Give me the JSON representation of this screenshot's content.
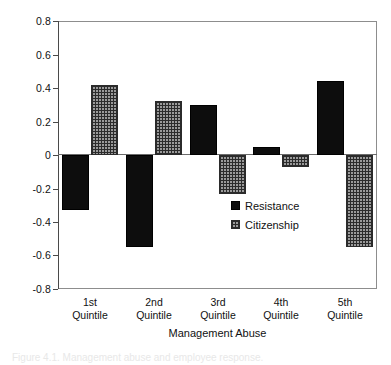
{
  "chart_data": {
    "type": "bar",
    "title": "",
    "xlabel": "Management Abuse",
    "ylabel": "",
    "categories": [
      "1st\nQuintile",
      "2nd\nQuintile",
      "3rd\nQuintile",
      "4th\nQuintile",
      "5th\nQuintile"
    ],
    "category_lines": [
      {
        "line1": "1st",
        "line2": "Quintile"
      },
      {
        "line1": "2nd",
        "line2": "Quintile"
      },
      {
        "line1": "3rd",
        "line2": "Quintile"
      },
      {
        "line1": "4th",
        "line2": "Quintile"
      },
      {
        "line1": "5th",
        "line2": "Quintile"
      }
    ],
    "series": [
      {
        "name": "Resistance",
        "values": [
          -0.33,
          -0.55,
          0.3,
          0.05,
          0.44
        ],
        "color": "#0d0d0d",
        "fill": "solid"
      },
      {
        "name": "Citizenship",
        "values": [
          0.42,
          0.32,
          -0.23,
          -0.07,
          -0.55
        ],
        "color": "#9a9a9a",
        "fill": "cross-hatch"
      }
    ],
    "ylim": [
      -0.8,
      0.8
    ],
    "ytick_values": [
      0.8,
      0.6,
      0.4,
      0.2,
      0,
      -0.2,
      -0.4,
      -0.6,
      -0.8
    ],
    "ytick_labels": [
      "0.8",
      "0.6",
      "0.4",
      "0.2",
      "0",
      "-0.2",
      "-0.4",
      "-0.6",
      "-0.8"
    ],
    "grid": false,
    "legend_position": "inside-center-right",
    "zero_line": true
  },
  "legend": {
    "items": [
      {
        "label": "Resistance"
      },
      {
        "label": "Citizenship"
      }
    ]
  },
  "axes": {
    "x_title": "Management Abuse"
  },
  "caption": {
    "text": "Figure 4.1. Management abuse and employee response."
  }
}
